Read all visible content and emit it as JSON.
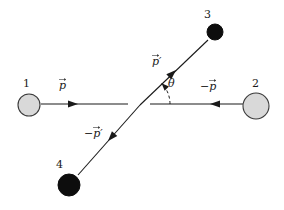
{
  "figure": {
    "kind": "physics-vector-diagram",
    "background_color": "#ffffff",
    "line_color": "#1a1a1a",
    "width": 284,
    "height": 210
  },
  "particles": [
    {
      "id": "particle-1",
      "label": "1",
      "fill": "#d9d9d9",
      "stroke": "#3a3a3a",
      "cx": 29,
      "cy": 105,
      "r": 11,
      "style": "open"
    },
    {
      "id": "particle-2",
      "label": "2",
      "fill": "#d9d9d9",
      "stroke": "#3a3a3a",
      "cx": 256,
      "cy": 106,
      "r": 13,
      "style": "open"
    },
    {
      "id": "particle-3",
      "label": "3",
      "fill": "#0d0d0d",
      "stroke": "#0d0d0d",
      "cx": 215,
      "cy": 32,
      "r": 8,
      "style": "filled"
    },
    {
      "id": "particle-4",
      "label": "4",
      "fill": "#0d0d0d",
      "stroke": "#0d0d0d",
      "cx": 69,
      "cy": 185,
      "r": 11,
      "style": "filled"
    }
  ],
  "vectors": [
    {
      "id": "vector-p",
      "label": "p",
      "sign": "",
      "prime": false,
      "x1": 41,
      "y1": 104,
      "x2": 128,
      "y2": 104,
      "arrow_at_x": 78,
      "arrow_at_y": 104,
      "arrow_direction": "right"
    },
    {
      "id": "vector-neg-p",
      "label": "p",
      "sign": "−",
      "prime": false,
      "x1": 243,
      "y1": 104,
      "x2": 150,
      "y2": 104,
      "arrow_at_x": 210,
      "arrow_at_y": 104,
      "arrow_direction": "left"
    },
    {
      "id": "vector-p-prime",
      "label": "p",
      "sign": "",
      "prime": true,
      "x1": 140,
      "y1": 105,
      "x2": 208,
      "y2": 40,
      "arrow_at_x": 176,
      "arrow_at_y": 70,
      "arrow_direction": "up-right"
    },
    {
      "id": "vector-neg-p-prime",
      "label": "p",
      "sign": "−",
      "prime": true,
      "x1": 140,
      "y1": 105,
      "x2": 78,
      "y2": 175,
      "arrow_at_x": 108,
      "arrow_at_y": 141,
      "arrow_direction": "down-left"
    }
  ],
  "angle": {
    "id": "scattering-angle",
    "label": "θ",
    "vertex_x": 140,
    "vertex_y": 104,
    "radius": 30,
    "start_deg": 0,
    "end_deg": 44,
    "style": "dashed",
    "dash_pattern": "3 2.5"
  },
  "labels": {
    "p": "p",
    "neg_p": "−p",
    "p_prime": "p′",
    "neg_p_prime": "−p′",
    "theta": "θ",
    "one": "1",
    "two": "2",
    "three": "3",
    "four": "4",
    "minus": "−",
    "prime_mark": "′"
  }
}
